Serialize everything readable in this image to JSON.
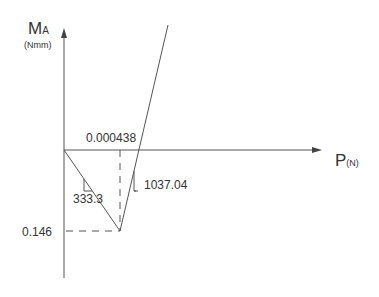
{
  "diagram": {
    "y_axis": {
      "label": "M",
      "label_sub": "A",
      "unit": "(Nmm)"
    },
    "x_axis": {
      "label": "P",
      "unit": "(N)"
    },
    "annotations": {
      "x_intercept": "0.000438",
      "slope_down": "333.3",
      "slope_up": "1037.04",
      "min_value": "0.146"
    },
    "colors": {
      "line": "#555555",
      "text": "#333333"
    }
  }
}
